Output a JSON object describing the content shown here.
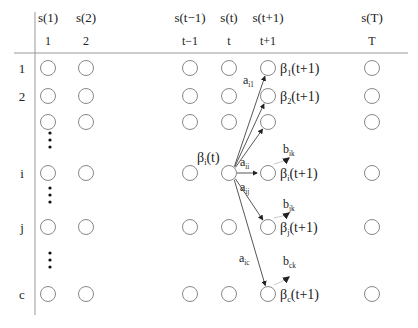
{
  "diagram": {
    "column_headers": [
      {
        "state": "s(1)",
        "time": "1",
        "x": 48
      },
      {
        "state": "s(2)",
        "time": "2",
        "x": 86
      },
      {
        "state": "s(t−1)",
        "time": "t−1",
        "x": 190
      },
      {
        "state": "s(t)",
        "time": "t",
        "x": 229
      },
      {
        "state": "s(t+1)",
        "time": "t+1",
        "x": 268
      },
      {
        "state": "s(T)",
        "time": "T",
        "x": 372
      }
    ],
    "row_labels": [
      {
        "label": "1",
        "y": 68
      },
      {
        "label": "2",
        "y": 96
      },
      {
        "label": "",
        "y": 122
      },
      {
        "label": "i",
        "y": 173
      },
      {
        "label": "j",
        "y": 227
      },
      {
        "label": "c",
        "y": 294
      }
    ],
    "ellipsis_rows": [
      140,
      195,
      260
    ],
    "beta_t_label": {
      "base": "β",
      "sub": "i",
      "rest": "(t)"
    },
    "beta_next_labels": [
      {
        "row": 0,
        "base": "β",
        "sub": "1",
        "rest": "(t+1)"
      },
      {
        "row": 1,
        "base": "β",
        "sub": "2",
        "rest": "(t+1)"
      },
      {
        "row": 3,
        "base": "β",
        "sub": "i",
        "rest": "(t+1)"
      },
      {
        "row": 4,
        "base": "β",
        "sub": "j",
        "rest": "(t+1)"
      },
      {
        "row": 5,
        "base": "β",
        "sub": "c",
        "rest": "(t+1)"
      }
    ],
    "transition_labels": [
      {
        "base": "a",
        "sub": "i1",
        "x": 243,
        "y": 84
      },
      {
        "base": "a",
        "sub": "ii",
        "x": 240,
        "y": 166
      },
      {
        "base": "a",
        "sub": "ij",
        "x": 240,
        "y": 191
      },
      {
        "base": "a",
        "sub": "ic",
        "x": 239,
        "y": 262
      }
    ],
    "emission_labels": [
      {
        "base": "b",
        "sub": "ik",
        "x": 283,
        "y": 153
      },
      {
        "base": "b",
        "sub": "jk",
        "x": 283,
        "y": 208
      },
      {
        "base": "b",
        "sub": "ck",
        "x": 283,
        "y": 265
      }
    ],
    "colors": {
      "circle": "#888888",
      "line": "#444444",
      "axis": "#999999",
      "emission": "#bbbbbb"
    }
  }
}
